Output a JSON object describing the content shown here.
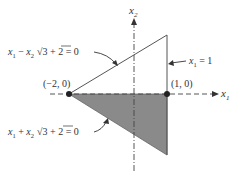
{
  "diagram": {
    "axes": {
      "x_label": "x",
      "x_sub": "1",
      "y_label": "x",
      "y_sub": "2"
    },
    "points": [
      {
        "label": "(−2, 0)"
      },
      {
        "label": "(1, 0)"
      }
    ],
    "constraints": [
      {
        "lhs_a": "x",
        "lhs_a_sub": "1",
        "op": " − ",
        "lhs_b": "x",
        "lhs_b_sub": "2",
        "rest": " + 2 = 0",
        "sqrt": "3"
      },
      {
        "label_var": "x",
        "label_sub": "1",
        "label_rest": " = 1"
      },
      {
        "lhs_a": "x",
        "lhs_a_sub": "1",
        "op": " + ",
        "lhs_b": "x",
        "lhs_b_sub": "2",
        "rest": " + 2 = 0",
        "sqrt": "3"
      }
    ],
    "colors": {
      "shade": "#8a8a8a",
      "line": "#555555",
      "text": "#333333"
    }
  }
}
